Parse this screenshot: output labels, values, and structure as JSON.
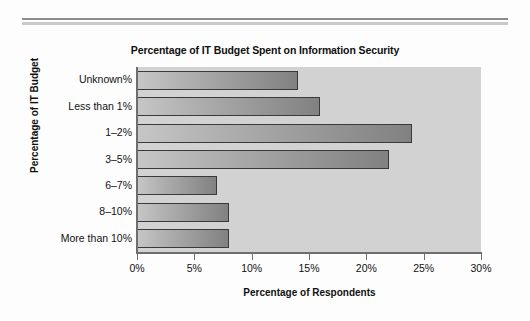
{
  "figure": {
    "background_color": "#fdfdfd",
    "rule_top_color": "#8d8d8d",
    "rule_bottom_color": "#c9c9c9"
  },
  "chart_data": {
    "type": "bar",
    "orientation": "horizontal",
    "title": "Percentage of IT Budget Spent on Information Security",
    "xlabel": "Percentage of Respondents",
    "ylabel": "Percentage of IT Budget",
    "categories": [
      "Unknown%",
      "Less than 1%",
      "1–2%",
      "3–5%",
      "6–7%",
      "8–10%",
      "More than 10%"
    ],
    "values": [
      14,
      16,
      24,
      22,
      7,
      8,
      8
    ],
    "xlim": [
      0,
      30
    ],
    "xticks": [
      0,
      5,
      10,
      15,
      20,
      25,
      30
    ],
    "xtick_labels": [
      "0%",
      "5%",
      "10%",
      "15%",
      "20%",
      "25%",
      "30%"
    ],
    "grid": false,
    "legend": false,
    "plot_background_color": "#d2d2d2",
    "bar_fill_light": "#c6c6c6",
    "bar_fill_dark": "#818181",
    "bar_edge_color": "#3a3a3a",
    "axis_color": "#6e6e6e"
  }
}
